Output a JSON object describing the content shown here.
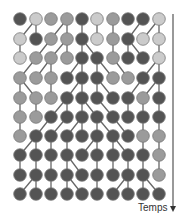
{
  "diagram": {
    "title": "",
    "axis_label": "Temps",
    "axis_direction": "down",
    "colors": {
      "L": "#cbcbcb",
      "M": "#9b9b9b",
      "D": "#545454",
      "edge": "#666666",
      "node_stroke": "#7a7a7a",
      "axis": "#555555"
    },
    "columns_x": [
      20,
      36,
      51,
      67,
      82,
      97,
      113,
      128,
      143,
      159
    ],
    "rows_y": [
      19,
      39,
      58,
      78,
      98,
      117,
      136,
      155,
      175,
      194
    ],
    "node_radius": 6.3,
    "rows": [
      {
        "shades": [
          "D",
          "L",
          "M",
          "M",
          "D",
          "L",
          "M",
          "D",
          "D",
          "L"
        ],
        "parents": null
      },
      {
        "shades": [
          "L",
          "D",
          "M",
          "M",
          "D",
          "L",
          "M",
          "D",
          "L",
          "L"
        ],
        "parents": [
          1,
          1,
          3,
          3,
          4,
          5,
          6,
          8,
          9,
          9
        ]
      },
      {
        "shades": [
          "L",
          "M",
          "M",
          "M",
          "D",
          "D",
          "M",
          "D",
          "D",
          "L"
        ],
        "parents": [
          0,
          2,
          3,
          3,
          4,
          4,
          6,
          7,
          7,
          9
        ]
      },
      {
        "shades": [
          "M",
          "M",
          "M",
          "D",
          "D",
          "D",
          "M",
          "M",
          "D",
          "D"
        ],
        "parents": [
          1,
          2,
          2,
          4,
          4,
          5,
          5,
          6,
          9,
          9
        ]
      },
      {
        "shades": [
          "M",
          "M",
          "M",
          "D",
          "D",
          "D",
          "D",
          "D",
          "M",
          "D"
        ],
        "parents": [
          0,
          0,
          2,
          4,
          4,
          5,
          5,
          8,
          9,
          9
        ]
      },
      {
        "shades": [
          "M",
          "M",
          "D",
          "D",
          "D",
          "D",
          "D",
          "D",
          "D",
          "D"
        ],
        "parents": [
          0,
          1,
          3,
          3,
          4,
          4,
          5,
          7,
          8,
          9
        ]
      },
      {
        "shades": [
          "M",
          "D",
          "D",
          "D",
          "D",
          "D",
          "D",
          "D",
          "M",
          "M"
        ],
        "parents": [
          0,
          2,
          3,
          4,
          4,
          5,
          5,
          6,
          8,
          9
        ]
      },
      {
        "shades": [
          "D",
          "D",
          "D",
          "D",
          "D",
          "D",
          "D",
          "D",
          "D",
          "M"
        ],
        "parents": [
          1,
          1,
          2,
          3,
          5,
          5,
          6,
          6,
          8,
          9
        ]
      },
      {
        "shades": [
          "D",
          "D",
          "D",
          "D",
          "D",
          "D",
          "D",
          "D",
          "D",
          "M"
        ],
        "parents": [
          0,
          1,
          2,
          3,
          3,
          5,
          6,
          7,
          8,
          9
        ]
      },
      {
        "shades": [
          "D",
          "D",
          "D",
          "D",
          "D",
          "D",
          "D",
          "D",
          "D",
          "D"
        ],
        "parents": [
          1,
          1,
          2,
          3,
          3,
          5,
          7,
          7,
          8,
          8
        ]
      }
    ]
  }
}
